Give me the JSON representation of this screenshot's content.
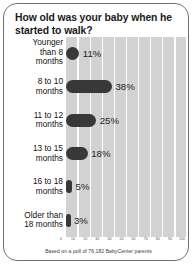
{
  "chart_data": {
    "type": "bar",
    "orientation": "horizontal",
    "title": "How old was your baby when he started to walk?",
    "categories": [
      "Younger than 8 months",
      "8 to 10 months",
      "11 to 12 months",
      "13 to 15 months",
      "16 to 18 months",
      "Older than 18 months"
    ],
    "category_lines": [
      [
        "Younger",
        "than 8",
        "months"
      ],
      [
        "8 to 10",
        "months"
      ],
      [
        "11 to 12",
        "months"
      ],
      [
        "13 to 15",
        "months"
      ],
      [
        "16 to 18",
        "months"
      ],
      [
        "Older than",
        "18 months"
      ]
    ],
    "values": [
      11,
      38,
      25,
      18,
      5,
      3
    ],
    "value_labels": [
      "11%",
      "38%",
      "25%",
      "18%",
      "5%",
      "3%"
    ],
    "xlabel": "",
    "ylabel": "",
    "xlim": [
      0,
      100
    ],
    "xticks": [
      0,
      10,
      20,
      30,
      40,
      50,
      60,
      70,
      80,
      90,
      100
    ],
    "xtick_labels": [
      "0",
      "10",
      "20",
      "30",
      "40",
      "50",
      "60",
      "70",
      "80",
      "90",
      "100"
    ],
    "grid": true,
    "legend": false,
    "bar_color": "#383838",
    "plot_background": "#d2d2d2",
    "gridline_color": "#ffffff"
  },
  "footnote": "Based on a poll of 76,182 BabyCenter parents"
}
